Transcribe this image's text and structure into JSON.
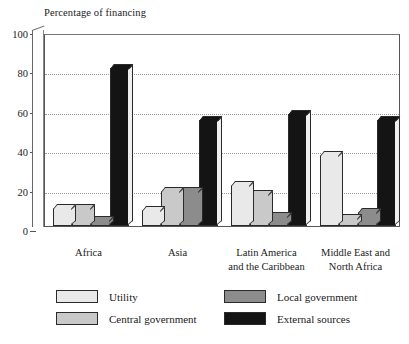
{
  "chart_data": {
    "type": "bar",
    "title": "Percentage of financing",
    "xlabel": "",
    "ylabel": "Percentage of financing",
    "ylim": [
      0,
      100
    ],
    "yticks": [
      0,
      20,
      40,
      60,
      80,
      100
    ],
    "grid": true,
    "legend_position": "bottom",
    "categories": [
      "Africa",
      "Asia",
      "Latin America\nand the Caribbean",
      "Middle East and\nNorth Africa"
    ],
    "series": [
      {
        "name": "Utility",
        "color": "#e9e9e9",
        "values": [
          9,
          8,
          21,
          36
        ]
      },
      {
        "name": "Central government",
        "color": "#c9c9c9",
        "values": [
          9,
          18,
          16,
          4
        ]
      },
      {
        "name": "Local government",
        "color": "#8c8c8c",
        "values": [
          3,
          18,
          5,
          7
        ]
      },
      {
        "name": "External sources",
        "color": "#141414",
        "values": [
          80,
          54,
          57,
          54
        ]
      }
    ]
  },
  "colors": {
    "utility": "#e9e9e9",
    "central_government": "#c9c9c9",
    "local_government": "#8c8c8c",
    "external_sources": "#141414",
    "axis": "#555555",
    "gridline": "#999999",
    "background": "#ffffff"
  }
}
